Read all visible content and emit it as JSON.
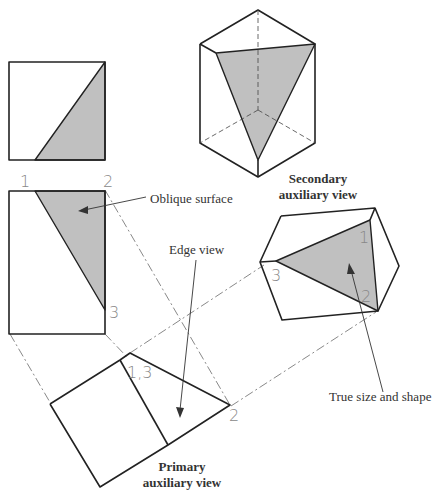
{
  "diagram": {
    "type": "orthographic-auxiliary-projection",
    "labels": {
      "oblique_surface": "Oblique surface",
      "edge_view": "Edge view",
      "secondary_title_line1": "Secondary",
      "secondary_title_line2": "auxiliary view",
      "primary_title_line1": "Primary",
      "primary_title_line2": "auxiliary view",
      "true_size": "True size and shape"
    },
    "point_labels": {
      "front_1": "1",
      "front_2": "2",
      "front_3": "3",
      "primary_13": "1,3",
      "primary_2": "2",
      "secondary_1": "1",
      "secondary_2": "2",
      "secondary_3": "3"
    },
    "colors": {
      "line": "#222222",
      "shaded_surface": "#c0c0c0",
      "text": "#333333",
      "point_label": "#888888"
    }
  }
}
